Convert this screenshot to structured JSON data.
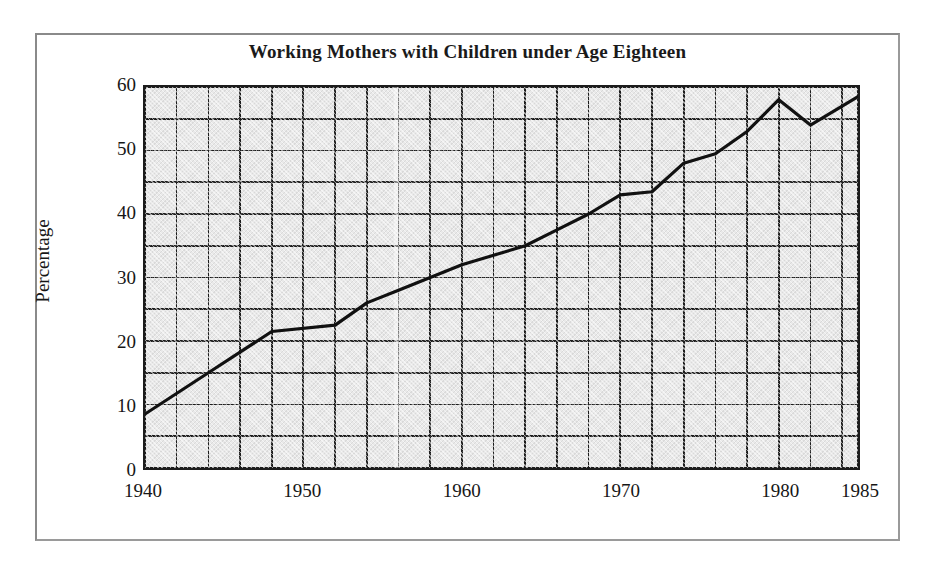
{
  "figure": {
    "title": "Working Mothers with Children under Age Eighteen"
  },
  "chart_data": {
    "type": "line",
    "title": "Working Mothers with Children under Age Eighteen",
    "xlabel": "",
    "ylabel": "Percentage",
    "xlim": [
      1940,
      1985
    ],
    "ylim": [
      0,
      60
    ],
    "x_tick_labels": [
      "1940",
      "1950",
      "1960",
      "1970",
      "1980",
      "1985"
    ],
    "x_tick_values": [
      1940,
      1950,
      1960,
      1970,
      1980,
      1985
    ],
    "y_tick_labels": [
      "0",
      "10",
      "20",
      "30",
      "40",
      "50",
      "60"
    ],
    "y_tick_values": [
      0,
      10,
      20,
      30,
      40,
      50,
      60
    ],
    "x_gridline_step": 2,
    "y_gridline_step": 5,
    "grid": true,
    "legend": false,
    "plot_background": "#e9e9e9",
    "line_color": "#111111",
    "series": [
      {
        "name": "Working mothers with children under age eighteen",
        "x": [
          1940,
          1944,
          1948,
          1952,
          1954,
          1956,
          1958,
          1960,
          1962,
          1964,
          1966,
          1968,
          1970,
          1972,
          1974,
          1976,
          1978,
          1980,
          1982,
          1985
        ],
        "values": [
          8.5,
          15.0,
          21.5,
          22.5,
          26.0,
          28.0,
          30.0,
          32.0,
          33.5,
          35.0,
          37.5,
          40.0,
          43.0,
          43.5,
          48.0,
          49.5,
          53.0,
          58.0,
          54.0,
          58.5
        ]
      }
    ]
  },
  "axes": {
    "y_title": "Percentage"
  }
}
